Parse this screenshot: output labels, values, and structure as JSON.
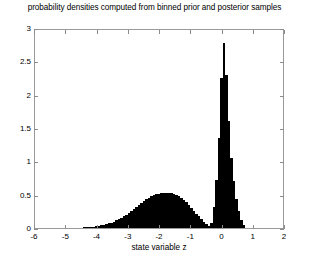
{
  "chart_data": {
    "type": "bar",
    "title": "probability densities computed from binned prior and posterior samples",
    "xlabel": "state variable z",
    "ylabel": "",
    "xlim": [
      -6,
      2
    ],
    "ylim": [
      0,
      3
    ],
    "xticks": [
      -6,
      -5,
      -4,
      -3,
      -2,
      -1,
      0,
      1,
      2
    ],
    "xticklabels": [
      "-6",
      "-5",
      "-4",
      "-3",
      "-2",
      "-1",
      "0",
      "1",
      "2"
    ],
    "yticks": [
      0,
      0.5,
      1,
      1.5,
      2,
      2.5,
      3
    ],
    "yticklabels": [
      "0",
      "0.5",
      "1",
      "1.5",
      "2",
      "2.5",
      "3"
    ],
    "grid": false,
    "legend": null,
    "bar_color": "#000000",
    "bin_width": 0.08,
    "series": [
      {
        "name": "prior density (broad mode)",
        "x": [
          -4.6,
          -4.52,
          -4.44,
          -4.36,
          -4.28,
          -4.2,
          -4.12,
          -4.04,
          -3.96,
          -3.88,
          -3.8,
          -3.72,
          -3.64,
          -3.56,
          -3.48,
          -3.4,
          -3.32,
          -3.24,
          -3.16,
          -3.08,
          -3.0,
          -2.92,
          -2.84,
          -2.76,
          -2.68,
          -2.6,
          -2.52,
          -2.44,
          -2.36,
          -2.28,
          -2.2,
          -2.12,
          -2.04,
          -1.96,
          -1.88,
          -1.8,
          -1.72,
          -1.64,
          -1.56,
          -1.48,
          -1.4,
          -1.32,
          -1.24,
          -1.16,
          -1.08,
          -1.0,
          -0.92,
          -0.84,
          -0.76,
          -0.68,
          -0.6,
          -0.52,
          -0.44
        ],
        "values": [
          0.005,
          0.007,
          0.008,
          0.01,
          0.013,
          0.016,
          0.02,
          0.025,
          0.03,
          0.038,
          0.046,
          0.056,
          0.068,
          0.082,
          0.097,
          0.114,
          0.133,
          0.154,
          0.177,
          0.202,
          0.228,
          0.256,
          0.285,
          0.315,
          0.345,
          0.374,
          0.402,
          0.428,
          0.452,
          0.473,
          0.491,
          0.505,
          0.516,
          0.523,
          0.527,
          0.529,
          0.528,
          0.522,
          0.512,
          0.497,
          0.476,
          0.45,
          0.419,
          0.384,
          0.345,
          0.303,
          0.26,
          0.216,
          0.173,
          0.132,
          0.094,
          0.06,
          0.028
        ]
      },
      {
        "name": "posterior density (sharp mode)",
        "x": [
          -0.36,
          -0.28,
          -0.2,
          -0.12,
          -0.04,
          0.04,
          0.12,
          0.2,
          0.28,
          0.36,
          0.44,
          0.52,
          0.6,
          0.68
        ],
        "values": [
          0.08,
          0.32,
          0.72,
          1.35,
          2.25,
          2.78,
          2.3,
          1.6,
          1.05,
          0.7,
          0.44,
          0.26,
          0.12,
          0.04
        ]
      }
    ],
    "annotations": {
      "prior_peak_value": 0.53,
      "prior_peak_location": -1.85,
      "posterior_peak_value": 2.78,
      "posterior_peak_location": 0.05
    }
  },
  "axes": {
    "box_color": "#9a9a9a",
    "tick_color": "#8c8c8c"
  }
}
